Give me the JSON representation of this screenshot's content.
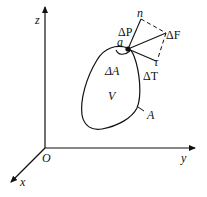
{
  "diagram": {
    "axes": {
      "origin_label": "O",
      "x_label": "x",
      "y_label": "y",
      "z_label": "z"
    },
    "body": {
      "volume_label": "V",
      "surface_label": "A",
      "element_area_label": "ΔA"
    },
    "point": {
      "label": "a"
    },
    "forces": {
      "total": "ΔF",
      "normal_component": "ΔP",
      "tangential_component": "ΔT",
      "normal_direction": "n",
      "tangent_direction": "τ"
    },
    "colors": {
      "stroke": "#111111",
      "background": "#ffffff"
    }
  }
}
